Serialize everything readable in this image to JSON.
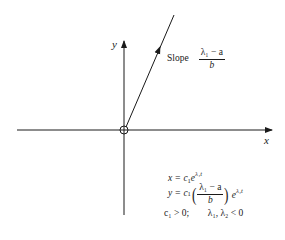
{
  "diagram": {
    "type": "phase-plane-trajectory",
    "axes": {
      "x_label": "x",
      "y_label": "y"
    },
    "trajectory": {
      "description": "straight-line trajectory through origin",
      "direction": "away from origin toward upper-right (arrow)",
      "slope_word": "Slope",
      "slope_numerator": "λ₁ − a",
      "slope_denominator": "b"
    },
    "origin_marker": "open circle",
    "equations": {
      "x_eq": "x = c₁e^{λ₁t}",
      "x_eq_lhs": "x = c",
      "x_eq_sub": "1",
      "x_eq_e": "e",
      "x_eq_exp": "λ₁t",
      "y_eq_lhs": "y = c",
      "y_eq_sub": "1",
      "y_frac_num": "λ₁ − a",
      "y_frac_den": "b",
      "y_eq_e": "e",
      "y_eq_exp": "λ₁t",
      "condition_c": "c₁ > 0;",
      "condition_lambda": "λ₁, λ₂ < 0"
    },
    "colors": {
      "ink": "#1a1a1a",
      "background": "#ffffff"
    }
  }
}
